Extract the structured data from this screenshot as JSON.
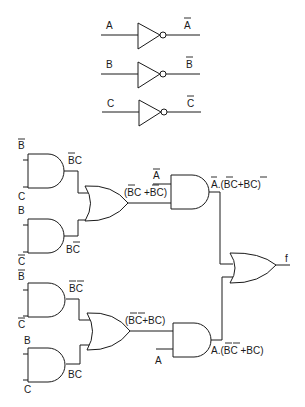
{
  "colors": {
    "ink": "#1a1a1a",
    "background": "#ffffff"
  },
  "inverters": [
    {
      "input": "A",
      "output": "A",
      "output_overbar": true
    },
    {
      "input": "B",
      "output": "B",
      "output_overbar": true
    },
    {
      "input": "C",
      "output": "C",
      "output_overbar": true
    }
  ],
  "upper_section": {
    "and1": {
      "in1": "B",
      "in1_bar": true,
      "in2": "C",
      "out": "BC",
      "out_note": "B-bar C"
    },
    "and2": {
      "in1": "B",
      "in2": "C",
      "in2_bar": true,
      "out": "BC",
      "out_note": "B C-bar"
    },
    "or_out": "(BC +BC)",
    "or_out_note": "(B-bar C + B C-bar)",
    "and3_in": "A",
    "and3_in_bar": true,
    "and3_out": "A.(BC+BC)",
    "and3_out_note": "A-bar.(B-bar C + B C-bar)"
  },
  "lower_section": {
    "and1": {
      "in1": "B",
      "in1_bar": true,
      "in2": "C",
      "in2_bar": true,
      "out": "BC",
      "out_note": "B-bar C-bar"
    },
    "and2": {
      "in1": "B",
      "in2": "C",
      "out": "BC"
    },
    "or_out": "(BC+BC)",
    "or_out_note": "(B-bar C-bar + BC)",
    "and3_in": "A",
    "and3_out": "A.(BC +BC)",
    "and3_out_note": "A.(B-bar C-bar + BC)"
  },
  "final_or_out": "f",
  "icons": [
    "not-gate",
    "and-gate",
    "or-gate"
  ]
}
